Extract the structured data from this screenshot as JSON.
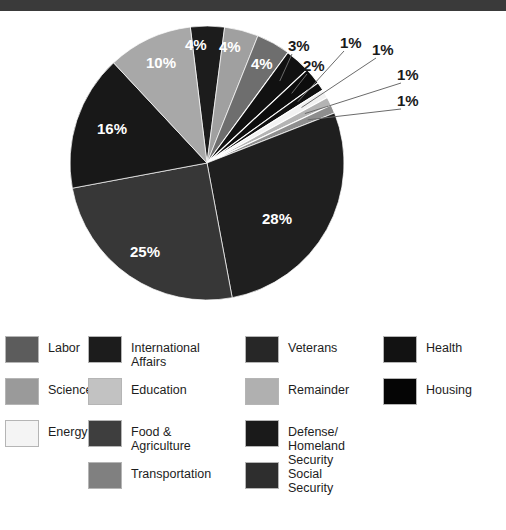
{
  "topbar": {
    "color": "#3a3a3a"
  },
  "chart_data": {
    "type": "pie",
    "title": "",
    "categories": [
      "Defense/ Homeland Security",
      "Social Security",
      "Health",
      "Veterans",
      "International Affairs",
      "Education",
      "Food & Agriculture",
      "Housing",
      "Transportation",
      "Science",
      "Energy",
      "Labor",
      "Remainder"
    ],
    "values": [
      28,
      25,
      16,
      10,
      4,
      4,
      4,
      3,
      2,
      1,
      1,
      1,
      1
    ],
    "labels_shown": [
      "28%",
      "25%",
      "16%",
      "10%",
      "4%",
      "4%",
      "4%",
      "3%",
      "2%",
      "1%",
      "1%",
      "1%",
      "1%"
    ],
    "legend_position": "bottom",
    "grid": false,
    "xlabel": "",
    "ylabel": ""
  },
  "pie": {
    "center_x": 207,
    "center_y": 152,
    "radius": 137,
    "slices": [
      {
        "name": "international-affairs",
        "pct": 4,
        "label": "4%",
        "color": "#1c1c1c",
        "label_x": 185,
        "label_y": 26,
        "inside": true
      },
      {
        "name": "education",
        "pct": 4,
        "label": "4%",
        "color": "#a0a0a0",
        "label_x": 219,
        "label_y": 28,
        "inside": true
      },
      {
        "name": "food-agriculture",
        "pct": 4,
        "label": "4%",
        "color": "#6e6e6e",
        "label_x": 251,
        "label_y": 45,
        "inside": true
      },
      {
        "name": "housing",
        "pct": 3,
        "label": "3%",
        "color": "#111111",
        "label_x": 288,
        "label_y": 27,
        "inside": false
      },
      {
        "name": "transportation",
        "pct": 2,
        "label": "2%",
        "color": "#0d0d0d",
        "label_x": 303,
        "label_y": 47,
        "inside": false
      },
      {
        "name": "science",
        "pct": 1,
        "label": "1%",
        "color": "#101010",
        "label_x": 340,
        "label_y": 24,
        "inside": false
      },
      {
        "name": "energy",
        "pct": 1,
        "label": "1%",
        "color": "#f2f2f2",
        "label_x": 372,
        "label_y": 31,
        "inside": false
      },
      {
        "name": "labor",
        "pct": 1,
        "label": "1%",
        "color": "#b4b4b4",
        "label_x": 397,
        "label_y": 56,
        "inside": false
      },
      {
        "name": "remainder",
        "pct": 1,
        "label": "1%",
        "color": "#8e8e8e",
        "label_x": 397,
        "label_y": 82,
        "inside": false
      },
      {
        "name": "defense-homeland",
        "pct": 28,
        "label": "28%",
        "color": "#1f1f1f",
        "label_x": 262,
        "label_y": 200,
        "inside": true
      },
      {
        "name": "social-security",
        "pct": 25,
        "label": "25%",
        "color": "#373737",
        "label_x": 130,
        "label_y": 233,
        "inside": true
      },
      {
        "name": "health",
        "pct": 16,
        "label": "16%",
        "color": "#181818",
        "label_x": 97,
        "label_y": 110,
        "inside": true
      },
      {
        "name": "veterans",
        "pct": 10,
        "label": "10%",
        "color": "#a8a8a8",
        "label_x": 146,
        "label_y": 44,
        "inside": true
      }
    ]
  },
  "legend": {
    "columns": [
      {
        "left": 5,
        "items": [
          {
            "label": "Labor",
            "color": "#5c5c5c",
            "top": 6
          },
          {
            "label": "Science",
            "color": "#9a9a9a",
            "top": 48
          },
          {
            "label": "Energy",
            "color": "#f4f4f4",
            "top": 90
          }
        ]
      },
      {
        "left": 88,
        "items": [
          {
            "label": "International Affairs",
            "color": "#1c1c1c",
            "top": 6
          },
          {
            "label": "Education",
            "color": "#c2c2c2",
            "top": 48
          },
          {
            "label": "Food & Agriculture",
            "color": "#3e3e3e",
            "top": 90
          },
          {
            "label": "Transportation",
            "color": "#808080",
            "top": 132
          }
        ]
      },
      {
        "left": 245,
        "items": [
          {
            "label": "Veterans",
            "color": "#272727",
            "top": 6
          },
          {
            "label": "Remainder",
            "color": "#b0b0b0",
            "top": 48
          },
          {
            "label": "Defense/\nHomeland Security",
            "color": "#1a1a1a",
            "top": 90
          },
          {
            "label": "Social Security",
            "color": "#2e2e2e",
            "top": 132
          }
        ]
      },
      {
        "left": 383,
        "items": [
          {
            "label": "Health",
            "color": "#121212",
            "top": 6
          },
          {
            "label": "Housing",
            "color": "#050505",
            "top": 48
          }
        ]
      }
    ]
  }
}
